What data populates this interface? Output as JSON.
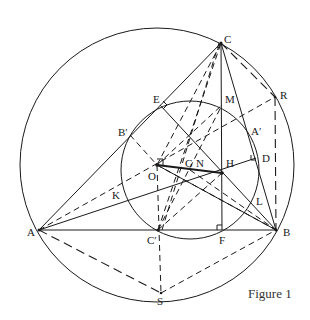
{
  "figure": {
    "caption": "Figure 1",
    "colors": {
      "ink": "#1a1a1a",
      "background": "#ffffff"
    }
  },
  "labels": {
    "C": "C",
    "R": "R",
    "E": "E",
    "M": "M",
    "B_prime": "B′",
    "A_prime": "A′",
    "D": "D",
    "O": "O",
    "G": "G",
    "N": "N",
    "H": "H",
    "K": "K",
    "L": "L",
    "A": "A",
    "B": "B",
    "C_prime": "C′",
    "F": "F",
    "S": "S"
  },
  "points": {
    "A": [
      39,
      230
    ],
    "B": [
      276,
      230
    ],
    "C": [
      221,
      43
    ],
    "R": [
      275,
      97
    ],
    "S": [
      161,
      293
    ],
    "E": [
      160,
      105
    ],
    "M": [
      222,
      105
    ],
    "B_prime": [
      130,
      135
    ],
    "A_prime": [
      250,
      127
    ],
    "D": [
      256,
      158
    ],
    "O": [
      157,
      165
    ],
    "G": [
      180,
      168
    ],
    "N": [
      190,
      170
    ],
    "H": [
      222,
      173
    ],
    "K": [
      123,
      192
    ],
    "L": [
      256,
      208
    ],
    "C_prime": [
      158,
      230
    ],
    "F": [
      222,
      230
    ]
  },
  "circles": {
    "circumcircle": {
      "cx": 157,
      "cy": 165,
      "r": 137
    },
    "nine_point_circle": {
      "cx": 190,
      "cy": 170,
      "r": 69
    }
  }
}
